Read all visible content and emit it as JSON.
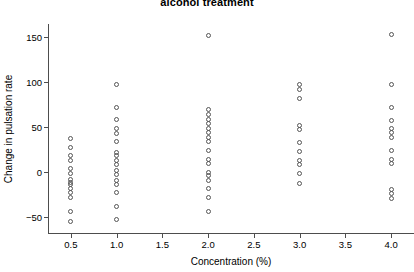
{
  "chart": {
    "title": "alcohol treatment",
    "xlabel": "Concentration (%)",
    "ylabel": "Change in pulsation rate",
    "x_ticks": [
      "0.5",
      "1.0",
      "1.5",
      "2.0",
      "2.5",
      "3.0",
      "3.5",
      "4.0"
    ],
    "y_ticks": [
      "‒50",
      "0",
      "50",
      "100",
      "150"
    ],
    "marker": "open-circle",
    "marker_color": "#555555",
    "axis_color": "#4d4d4d",
    "background": "#ffffff"
  },
  "chart_data": {
    "type": "scatter",
    "title": "alcohol treatment",
    "xlabel": "Concentration (%)",
    "ylabel": "Change in pulsation rate",
    "xlim": [
      0.25,
      4.25
    ],
    "ylim": [
      -68,
      165
    ],
    "xticks": [
      0.5,
      1.0,
      1.5,
      2.0,
      2.5,
      3.0,
      3.5,
      4.0
    ],
    "yticks": [
      -50,
      0,
      50,
      100,
      150
    ],
    "grid": false,
    "legend": null,
    "series": [
      {
        "name": "Change in pulsation rate",
        "points": [
          {
            "x": 0.5,
            "y": 37
          },
          {
            "x": 0.5,
            "y": 27
          },
          {
            "x": 0.5,
            "y": 18
          },
          {
            "x": 0.5,
            "y": 13
          },
          {
            "x": 0.5,
            "y": 4
          },
          {
            "x": 0.5,
            "y": -2
          },
          {
            "x": 0.5,
            "y": -8
          },
          {
            "x": 0.5,
            "y": -12
          },
          {
            "x": 0.5,
            "y": -14
          },
          {
            "x": 0.5,
            "y": -18
          },
          {
            "x": 0.5,
            "y": -23
          },
          {
            "x": 0.5,
            "y": -28
          },
          {
            "x": 0.5,
            "y": -44
          },
          {
            "x": 0.5,
            "y": -55
          },
          {
            "x": 1.0,
            "y": 97
          },
          {
            "x": 1.0,
            "y": 72
          },
          {
            "x": 1.0,
            "y": 58
          },
          {
            "x": 1.0,
            "y": 48
          },
          {
            "x": 1.0,
            "y": 43
          },
          {
            "x": 1.0,
            "y": 34
          },
          {
            "x": 1.0,
            "y": 22
          },
          {
            "x": 1.0,
            "y": 18
          },
          {
            "x": 1.0,
            "y": 13
          },
          {
            "x": 1.0,
            "y": 8
          },
          {
            "x": 1.0,
            "y": 2
          },
          {
            "x": 1.0,
            "y": -3
          },
          {
            "x": 1.0,
            "y": -9
          },
          {
            "x": 1.0,
            "y": -14
          },
          {
            "x": 1.0,
            "y": -23
          },
          {
            "x": 1.0,
            "y": -39
          },
          {
            "x": 1.0,
            "y": -53
          },
          {
            "x": 2.0,
            "y": 152
          },
          {
            "x": 2.0,
            "y": 70
          },
          {
            "x": 2.0,
            "y": 64
          },
          {
            "x": 2.0,
            "y": 59
          },
          {
            "x": 2.0,
            "y": 54
          },
          {
            "x": 2.0,
            "y": 49
          },
          {
            "x": 2.0,
            "y": 44
          },
          {
            "x": 2.0,
            "y": 39
          },
          {
            "x": 2.0,
            "y": 34
          },
          {
            "x": 2.0,
            "y": 24
          },
          {
            "x": 2.0,
            "y": 14
          },
          {
            "x": 2.0,
            "y": 9
          },
          {
            "x": 2.0,
            "y": 0
          },
          {
            "x": 2.0,
            "y": -4
          },
          {
            "x": 2.0,
            "y": -9
          },
          {
            "x": 2.0,
            "y": -18
          },
          {
            "x": 2.0,
            "y": -28
          },
          {
            "x": 2.0,
            "y": -44
          },
          {
            "x": 3.0,
            "y": 97
          },
          {
            "x": 3.0,
            "y": 92
          },
          {
            "x": 3.0,
            "y": 82
          },
          {
            "x": 3.0,
            "y": 52
          },
          {
            "x": 3.0,
            "y": 47
          },
          {
            "x": 3.0,
            "y": 33
          },
          {
            "x": 3.0,
            "y": 23
          },
          {
            "x": 3.0,
            "y": 13
          },
          {
            "x": 3.0,
            "y": 8
          },
          {
            "x": 3.0,
            "y": -2
          },
          {
            "x": 3.0,
            "y": -13
          },
          {
            "x": 4.0,
            "y": 153
          },
          {
            "x": 4.0,
            "y": 97
          },
          {
            "x": 4.0,
            "y": 72
          },
          {
            "x": 4.0,
            "y": 57
          },
          {
            "x": 4.0,
            "y": 48
          },
          {
            "x": 4.0,
            "y": 44
          },
          {
            "x": 4.0,
            "y": 38
          },
          {
            "x": 4.0,
            "y": 24
          },
          {
            "x": 4.0,
            "y": 14
          },
          {
            "x": 4.0,
            "y": 9
          },
          {
            "x": 4.0,
            "y": -19
          },
          {
            "x": 4.0,
            "y": -24
          },
          {
            "x": 4.0,
            "y": -29
          }
        ]
      }
    ]
  }
}
